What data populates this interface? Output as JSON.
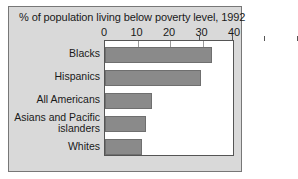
{
  "chart_data": {
    "type": "bar",
    "orientation": "horizontal",
    "title": "% of population living below poverty level, 1992",
    "xlabel": "",
    "ylabel": "",
    "xlim": [
      0,
      40
    ],
    "xticks": [
      0,
      10,
      20,
      30,
      40
    ],
    "xtick_labels": [
      "0",
      "10",
      "20",
      "30",
      "40"
    ],
    "grid": false,
    "legend": false,
    "categories": [
      "Blacks",
      "Hispanics",
      "All Americans",
      "Asians and Pacific\nislanders",
      "Whites"
    ],
    "values": [
      33,
      29.5,
      14.5,
      12.5,
      11.5
    ],
    "bar_color": "#8a8a8a",
    "bar_edge_color": "#6f6f6f",
    "plot_background": "#ffffff",
    "panel_background": "#d9d9d9",
    "axis_color": "#555555",
    "text_color": "#1a1a1a"
  }
}
